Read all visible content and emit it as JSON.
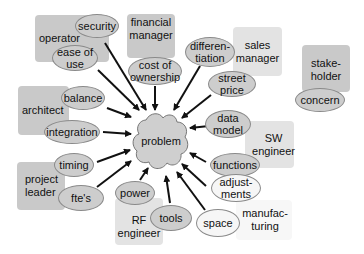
{
  "diagram": {
    "center": {
      "label": "problem"
    },
    "stakeholders": [
      {
        "id": "operator",
        "label": "operator"
      },
      {
        "id": "financial-manager",
        "label": "financial\nmanager"
      },
      {
        "id": "sales-manager",
        "label": "sales\nmanager"
      },
      {
        "id": "stakeholder",
        "label": "stake-\nholder"
      },
      {
        "id": "architect",
        "label": "architect"
      },
      {
        "id": "sw-engineer",
        "label": "SW\nengineer"
      },
      {
        "id": "project-leader",
        "label": "project\nleader"
      },
      {
        "id": "rf-engineer",
        "label": "RF\nengineer"
      },
      {
        "id": "manufacturing",
        "label": "manufac-\nturing"
      }
    ],
    "concerns": [
      {
        "id": "security",
        "label": "security",
        "owner": "operator"
      },
      {
        "id": "ease-of-use",
        "label": "ease of\nuse",
        "owner": "operator"
      },
      {
        "id": "cost-of-ownership",
        "label": "cost of\nownership",
        "owner": "financial manager"
      },
      {
        "id": "differentiation",
        "label": "differen-\ntiation",
        "owner": "sales manager"
      },
      {
        "id": "street-price",
        "label": "street\nprice",
        "owner": "sales manager"
      },
      {
        "id": "concern",
        "label": "concern",
        "owner": "stakeholder"
      },
      {
        "id": "balance",
        "label": "balance",
        "owner": "architect"
      },
      {
        "id": "integration",
        "label": "integration",
        "owner": "architect"
      },
      {
        "id": "data-model",
        "label": "data\nmodel",
        "owner": "SW engineer"
      },
      {
        "id": "functions",
        "label": "functions",
        "owner": "SW engineer"
      },
      {
        "id": "timing",
        "label": "timing",
        "owner": "project leader"
      },
      {
        "id": "ftes",
        "label": "fte's",
        "owner": "project leader"
      },
      {
        "id": "power",
        "label": "power",
        "owner": "RF engineer"
      },
      {
        "id": "tools",
        "label": "tools",
        "owner": "RF engineer"
      },
      {
        "id": "adjustments",
        "label": "adjust-\nments",
        "owner": "manufacturing"
      },
      {
        "id": "space",
        "label": "space",
        "owner": "manufacturing"
      }
    ]
  },
  "colors": {
    "box_dark": "#c9c9c9",
    "box_light": "#e3e3e3",
    "oval_gray": "#cdcdcd",
    "oval_white": "#f6f6f6",
    "arrow": "#111111"
  }
}
